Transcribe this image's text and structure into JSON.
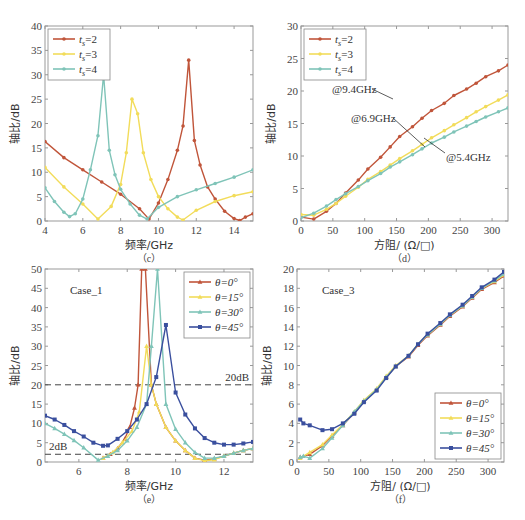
{
  "colors": {
    "red": "#c0553a",
    "yellow": "#f2dc5a",
    "teal": "#7fc4b8",
    "blue": "#3a4f9e",
    "axis": "#999999",
    "dash": "#444444"
  },
  "chart_data": [
    {
      "id": "c",
      "type": "line",
      "caption": "（c）",
      "xlabel": "频率/GHz",
      "ylabel": "轴比/dB",
      "xlim": [
        4,
        15
      ],
      "ylim": [
        0,
        40
      ],
      "xticks": [
        4,
        6,
        8,
        10,
        12,
        14
      ],
      "yticks": [
        0,
        5,
        10,
        15,
        20,
        25,
        30,
        35,
        40
      ],
      "legend_position": "upper-left",
      "series": [
        {
          "name": "t_s=2",
          "legend": "ts=2",
          "color": "red",
          "marker": "circle",
          "x": [
            4,
            5,
            6,
            7,
            8,
            9,
            9.5,
            10,
            10.5,
            11,
            11.3,
            11.6,
            11.9,
            12.2,
            12.6,
            13,
            13.5,
            14,
            14.3,
            14.6,
            15
          ],
          "y": [
            16.3,
            13,
            10.5,
            8,
            5.5,
            2.5,
            0.4,
            3.7,
            8.5,
            14.5,
            19.5,
            33,
            16.5,
            11.5,
            7,
            4.5,
            2,
            0.5,
            0.1,
            0.8,
            1.5
          ]
        },
        {
          "name": "t_s=3",
          "legend": "ts=3",
          "color": "yellow",
          "marker": "circle",
          "x": [
            4,
            5,
            6,
            6.8,
            7.5,
            8,
            8.3,
            8.6,
            8.9,
            9.2,
            9.6,
            10,
            10.5,
            11,
            11.3,
            12,
            13,
            14,
            15
          ],
          "y": [
            11,
            7,
            3.5,
            0.4,
            3,
            7.5,
            14,
            25,
            22,
            14,
            8.5,
            5,
            2.5,
            0.8,
            0.2,
            2.2,
            4,
            5.2,
            6
          ]
        },
        {
          "name": "t_s=4",
          "legend": "ts=4",
          "color": "teal",
          "marker": "circle",
          "x": [
            4,
            4.5,
            5,
            5.3,
            5.6,
            6,
            6.4,
            6.8,
            7.1,
            7.4,
            7.7,
            8,
            8.5,
            9,
            9.4,
            10,
            11,
            12,
            13,
            14,
            15
          ],
          "y": [
            6.8,
            4,
            1.8,
            0.9,
            1.5,
            4.5,
            10.5,
            17.5,
            30,
            14.5,
            9.5,
            6.5,
            3.5,
            1.2,
            0.4,
            2.8,
            5,
            6.4,
            7.7,
            9,
            10.5
          ]
        }
      ]
    },
    {
      "id": "d",
      "type": "line",
      "caption": "（d）",
      "xlabel": "方阻/ (Ω/□)",
      "ylabel": "轴比/dB",
      "xlim": [
        0,
        325
      ],
      "ylim": [
        0,
        30
      ],
      "xticks": [
        0,
        50,
        100,
        150,
        200,
        250,
        300
      ],
      "yticks": [
        0,
        5,
        10,
        15,
        20,
        25,
        30
      ],
      "legend_position": "upper-left",
      "annotations": [
        "@9.4GHz",
        "@6.9GHz",
        "@5.4GHz"
      ],
      "series": [
        {
          "name": "t_s=2",
          "legend": "ts=2",
          "color": "red",
          "marker": "circle",
          "annotation": "@9.4GHz",
          "x": [
            0,
            20,
            40,
            55,
            70,
            90,
            105,
            125,
            140,
            155,
            175,
            190,
            205,
            225,
            240,
            260,
            275,
            290,
            310,
            325
          ],
          "y": [
            0.6,
            0.3,
            1.5,
            2.7,
            4.3,
            6.3,
            8,
            9.8,
            11.4,
            13,
            14.5,
            15.8,
            17,
            18.1,
            19.3,
            20.3,
            21.2,
            22.2,
            23.1,
            24
          ]
        },
        {
          "name": "t_s=3",
          "legend": "ts=3",
          "color": "yellow",
          "marker": "circle",
          "annotation": "@6.9GHz",
          "x": [
            0,
            20,
            40,
            55,
            70,
            90,
            105,
            125,
            140,
            155,
            175,
            190,
            205,
            225,
            240,
            260,
            275,
            290,
            310,
            325
          ],
          "y": [
            1,
            0.9,
            1.8,
            2.7,
            3.8,
            5.2,
            6.4,
            7.6,
            8.6,
            9.6,
            10.8,
            11.8,
            12.8,
            13.9,
            14.8,
            15.9,
            16.8,
            17.6,
            18.6,
            19.4
          ]
        },
        {
          "name": "t_s=4",
          "legend": "ts=4",
          "color": "teal",
          "marker": "circle",
          "annotation": "@5.4GHz",
          "x": [
            0,
            20,
            40,
            55,
            70,
            90,
            105,
            125,
            140,
            155,
            175,
            190,
            205,
            225,
            240,
            260,
            275,
            290,
            310,
            325
          ],
          "y": [
            0.5,
            1.2,
            2.3,
            3.3,
            4.2,
            5.3,
            6.2,
            7.3,
            8.3,
            9.1,
            10.2,
            11.1,
            12,
            12.9,
            13.7,
            14.6,
            15.3,
            16,
            16.8,
            17.4
          ]
        }
      ]
    },
    {
      "id": "e",
      "type": "line",
      "caption": "（e）",
      "title": "Case_1",
      "xlabel": "频率/GHz",
      "ylabel": "轴比/dB",
      "xlim": [
        4.6,
        13.2
      ],
      "ylim": [
        0,
        50
      ],
      "xticks": [
        6,
        8,
        10,
        12
      ],
      "yticks": [
        0,
        5,
        10,
        15,
        20,
        25,
        30,
        35,
        40,
        45,
        50
      ],
      "legend_position": "upper-right",
      "reference_lines": [
        {
          "y": 20,
          "label": "20dB"
        },
        {
          "y": 2,
          "label": "2dB"
        }
      ],
      "series": [
        {
          "name": "θ=0°",
          "color": "red",
          "marker": "triangle",
          "x": [
            7,
            7.3,
            7.6,
            7.9,
            8.1,
            8.3,
            8.45,
            8.6,
            8.75,
            9.0,
            9.2,
            9.6,
            10,
            10.4,
            10.8,
            11.2,
            11.6,
            12,
            12.4,
            12.8,
            13.2
          ],
          "y": [
            1,
            2,
            3.5,
            6,
            9,
            14,
            20,
            50,
            50,
            20,
            15,
            9,
            5.5,
            3,
            1,
            0.5,
            0.8,
            1.5,
            2.3,
            3,
            3.5
          ]
        },
        {
          "name": "θ=15°",
          "color": "yellow",
          "marker": "triangle",
          "x": [
            7,
            7.4,
            7.8,
            8.2,
            8.5,
            8.8,
            9.0,
            9.2,
            9.6,
            10,
            10.4,
            10.8,
            11.2,
            11.6,
            12,
            12.4,
            12.8,
            13.2
          ],
          "y": [
            1,
            2.5,
            5,
            8,
            13,
            30,
            20,
            15,
            9,
            5.5,
            3,
            1,
            0.3,
            0.6,
            1.5,
            2.3,
            3,
            3.5
          ]
        },
        {
          "name": "θ=30°",
          "color": "teal",
          "marker": "triangle",
          "x": [
            4.6,
            5,
            5.4,
            5.8,
            6.2,
            6.8,
            7.2,
            7.6,
            8,
            8.4,
            8.8,
            9.0,
            9.25,
            9.6,
            10,
            10.4,
            10.8,
            11.2,
            11.6,
            12,
            12.4,
            12.8,
            13.2
          ],
          "y": [
            10,
            8.7,
            7.2,
            5.6,
            3.7,
            0.5,
            1.5,
            3,
            5.5,
            9,
            15,
            30,
            50,
            15,
            8.5,
            5,
            2.5,
            1,
            1,
            1.5,
            2.3,
            3,
            3.5
          ]
        },
        {
          "name": "θ=45°",
          "color": "blue",
          "marker": "square",
          "x": [
            4.6,
            5,
            5.4,
            5.8,
            6.2,
            6.6,
            7,
            7.2,
            7.6,
            8,
            8.4,
            8.8,
            9.2,
            9.6,
            10,
            10.4,
            10.8,
            11.2,
            11.6,
            12,
            12.4,
            12.8,
            13.2
          ],
          "y": [
            12,
            11,
            9.6,
            8,
            6.6,
            5,
            4.2,
            4.3,
            6,
            8,
            11,
            15,
            22,
            35.5,
            18,
            12.3,
            8.7,
            6.2,
            5,
            4.5,
            4.5,
            4.8,
            5.2
          ]
        }
      ]
    },
    {
      "id": "f",
      "type": "line",
      "caption": "（f）",
      "title": "Case_3",
      "xlabel": "方阻/ (Ω/□)",
      "ylabel": "轴比/dB",
      "xlim": [
        0,
        325
      ],
      "ylim": [
        0,
        20
      ],
      "xticks": [
        0,
        50,
        100,
        150,
        200,
        250,
        300
      ],
      "yticks": [
        0,
        2,
        4,
        6,
        8,
        10,
        12,
        14,
        16,
        18,
        20
      ],
      "legend_position": "lower-right",
      "series": [
        {
          "name": "θ=0°",
          "color": "red",
          "marker": "triangle",
          "x": [
            5,
            20,
            40,
            55,
            72,
            90,
            105,
            125,
            140,
            155,
            175,
            190,
            205,
            225,
            240,
            260,
            275,
            290,
            310,
            325
          ],
          "y": [
            0.5,
            0.8,
            1.7,
            2.7,
            3.8,
            5.1,
            6.3,
            7.5,
            8.8,
            9.9,
            10.9,
            12.1,
            13.1,
            14.2,
            15.1,
            16.1,
            17,
            17.9,
            18.6,
            19.3
          ]
        },
        {
          "name": "θ=15°",
          "color": "yellow",
          "marker": "triangle",
          "x": [
            5,
            20,
            40,
            55,
            72,
            90,
            105,
            125,
            140,
            155,
            175,
            190,
            205,
            225,
            240,
            260,
            275,
            290,
            310,
            325
          ],
          "y": [
            0.4,
            1,
            1.8,
            2.8,
            3.9,
            5.2,
            6.4,
            7.6,
            8.9,
            10,
            11,
            12.2,
            13.2,
            14.3,
            15.2,
            16.2,
            17.1,
            18,
            18.7,
            19.4
          ]
        },
        {
          "name": "θ=30°",
          "color": "teal",
          "marker": "triangle",
          "x": [
            5,
            10,
            20,
            40,
            55,
            72,
            90,
            105,
            125,
            140,
            155,
            175,
            190,
            205,
            225,
            240,
            260,
            275,
            290,
            310,
            325
          ],
          "y": [
            0.5,
            0.6,
            0.4,
            1.4,
            2.5,
            3.8,
            5.2,
            6.3,
            7.5,
            8.8,
            9.9,
            11,
            12.2,
            13.2,
            14.3,
            15.2,
            16.2,
            17.1,
            18,
            18.8,
            19.5
          ]
        },
        {
          "name": "θ=45°",
          "color": "blue",
          "marker": "square",
          "x": [
            5,
            10,
            20,
            40,
            55,
            72,
            90,
            105,
            125,
            140,
            155,
            175,
            190,
            205,
            225,
            240,
            260,
            275,
            290,
            310,
            325
          ],
          "y": [
            4.4,
            4,
            3.8,
            3.3,
            3.4,
            4,
            5,
            6.2,
            7.4,
            8.7,
            9.9,
            11,
            12.2,
            13.3,
            14.4,
            15.3,
            16.3,
            17.2,
            18.1,
            18.9,
            19.7
          ]
        }
      ]
    }
  ],
  "layout": {
    "panels": [
      {
        "id": "c",
        "x0": 45,
        "y0": 26,
        "x1": 253,
        "y1": 221
      },
      {
        "id": "d",
        "x0": 301,
        "y0": 26,
        "x1": 508,
        "y1": 221
      },
      {
        "id": "e",
        "x0": 45,
        "y0": 269,
        "x1": 253,
        "y1": 462
      },
      {
        "id": "f",
        "x0": 297,
        "y0": 269,
        "x1": 504,
        "y1": 462
      }
    ]
  }
}
